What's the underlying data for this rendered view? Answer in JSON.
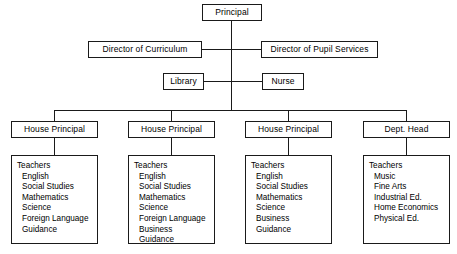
{
  "diagram": {
    "line_color": "#1a1a1a",
    "background_color": "#ffffff",
    "nodes": {
      "principal": "Principal",
      "director_curriculum": "Director of Curriculum",
      "director_pupil_services": "Director of Pupil Services",
      "library": "Library",
      "nurse": "Nurse",
      "house_principal_1": "House Principal",
      "house_principal_2": "House Principal",
      "house_principal_3": "House Principal",
      "dept_head": "Dept. Head"
    },
    "staff_lists": [
      {
        "heading": "Teachers",
        "items": [
          "English",
          "Social Studies",
          "Mathematics",
          "Science",
          "Foreign Language",
          "Guidance"
        ]
      },
      {
        "heading": "Teachers",
        "items": [
          "English",
          "Social Studies",
          "Mathematics",
          "Science",
          "Foreign Language",
          "Business",
          "Guidance"
        ]
      },
      {
        "heading": "Teachers",
        "items": [
          "English",
          "Social Studies",
          "Mathematics",
          "Science",
          "Business",
          "Guidance"
        ]
      },
      {
        "heading": "Teachers",
        "items": [
          "Music",
          "Fine Arts",
          "Industrial Ed.",
          "Home Economics",
          "Physical Ed."
        ]
      }
    ]
  }
}
